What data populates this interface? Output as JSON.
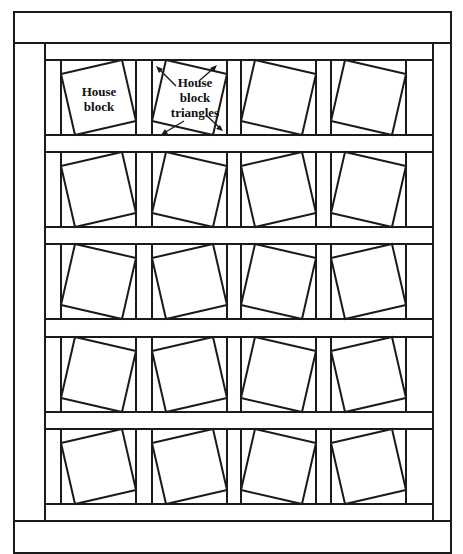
{
  "diagram": {
    "colors": {
      "line": "#1a1a1a",
      "fill": "#ffffff"
    },
    "grid": {
      "rows": 5,
      "cols": 4
    },
    "labels": {
      "house_block": [
        "House",
        "block"
      ],
      "house_block_triangles": [
        "House",
        "block",
        "triangles"
      ]
    },
    "tilts": [
      [
        "ccw",
        "cw",
        "cw",
        "cw"
      ],
      [
        "ccw",
        "cw",
        "ccw",
        "cw"
      ],
      [
        "cw",
        "ccw",
        "cw",
        "ccw"
      ],
      [
        "cw",
        "ccw",
        "cw",
        "ccw"
      ],
      [
        "ccw",
        "ccw",
        "cw",
        "ccw"
      ]
    ],
    "geometry": {
      "outer": [
        14,
        12,
        451,
        553
      ],
      "inner": [
        45,
        43,
        420,
        521
      ],
      "block_x": [
        61,
        152,
        241,
        331
      ],
      "block_y": [
        60,
        152,
        244,
        337,
        429
      ],
      "block_size": 75,
      "tilt_offset": 14
    }
  }
}
